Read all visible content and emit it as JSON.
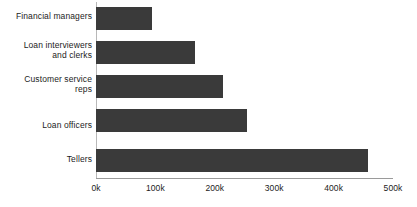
{
  "chart_data": {
    "type": "bar",
    "orientation": "horizontal",
    "title": "",
    "subtitle": "",
    "xlabel": "",
    "ylabel": "",
    "categories": [
      "Financial managers",
      "Loan interviewers and clerks",
      "Customer service reps",
      "Loan officers",
      "Tellers"
    ],
    "category_lines": [
      [
        "Financial managers"
      ],
      [
        "Loan interviewers",
        "and clerks"
      ],
      [
        "Customer service",
        "reps"
      ],
      [
        "Loan officers"
      ],
      [
        "Tellers"
      ]
    ],
    "values": [
      94000,
      167000,
      214000,
      254000,
      458000
    ],
    "xlim": [
      0,
      500000
    ],
    "xticks": [
      0,
      100000,
      200000,
      300000,
      400000,
      500000
    ],
    "xtick_labels": [
      "0k",
      "100k",
      "200k",
      "300k",
      "400k",
      "500k"
    ],
    "grid": false,
    "legend": null,
    "bar_color": "#3a3a3a",
    "axis_color": "#9a9a9a",
    "text_color": "#1c1c1c",
    "background_color": "#ffffff"
  }
}
